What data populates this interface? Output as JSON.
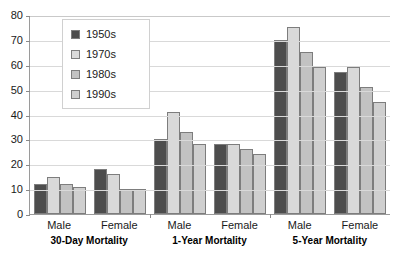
{
  "chart_data": {
    "type": "bar",
    "title": "",
    "xlabel": "",
    "ylabel": "",
    "ylim": [
      0,
      80
    ],
    "ytick_step": 10,
    "yticks": [
      80,
      70,
      60,
      50,
      40,
      30,
      20,
      10,
      0
    ],
    "grid": true,
    "legend_position": "top-left-inside",
    "categories": [
      "30-Day Mortality – Male",
      "30-Day Mortality – Female",
      "1-Year Mortality – Male",
      "1-Year Mortality – Female",
      "5-Year Mortality – Male",
      "5-Year Mortality – Female"
    ],
    "series": [
      {
        "name": "1950s",
        "color": "#4d4d4d",
        "values": [
          12,
          18,
          30,
          28,
          70,
          57
        ]
      },
      {
        "name": "1970s",
        "color": "#d9d9d9",
        "values": [
          15,
          16,
          41,
          28,
          75,
          59
        ]
      },
      {
        "name": "1980s",
        "color": "#c2c2c2",
        "values": [
          12,
          10,
          33,
          26,
          65,
          51
        ]
      },
      {
        "name": "1990s",
        "color": "#cfcfcf",
        "values": [
          11,
          10,
          28,
          24,
          59,
          45
        ]
      }
    ],
    "groups": [
      {
        "group_label": "30-Day Mortality",
        "subgroups": [
          {
            "label": "Male",
            "values": [
              12,
              15,
              12,
              11
            ]
          },
          {
            "label": "Female",
            "values": [
              18,
              16,
              10,
              10
            ]
          }
        ]
      },
      {
        "group_label": "1-Year Mortality",
        "subgroups": [
          {
            "label": "Male",
            "values": [
              30,
              41,
              33,
              28
            ]
          },
          {
            "label": "Female",
            "values": [
              28,
              28,
              26,
              24
            ]
          }
        ]
      },
      {
        "group_label": "5-Year Mortality",
        "subgroups": [
          {
            "label": "Male",
            "values": [
              70,
              75,
              65,
              59
            ]
          },
          {
            "label": "Female",
            "values": [
              57,
              59,
              51,
              45
            ]
          }
        ]
      }
    ]
  },
  "legend": {
    "items": [
      {
        "label": "1950s",
        "color": "#4d4d4d"
      },
      {
        "label": "1970s",
        "color": "#d9d9d9"
      },
      {
        "label": "1980s",
        "color": "#c2c2c2"
      },
      {
        "label": "1990s",
        "color": "#cfcfcf"
      }
    ]
  },
  "colors": {
    "axis": "#9a9a9a",
    "gridline": "#d9d9d9",
    "bar_border": "#7d7d7d",
    "text": "#1a1a1a",
    "background": "#ffffff"
  }
}
